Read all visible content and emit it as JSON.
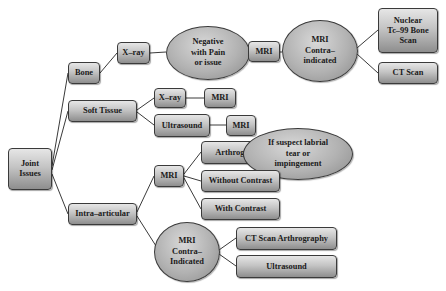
{
  "diagram": {
    "type": "tree",
    "root": "Joint Issues",
    "colors": {
      "node_fill_top": "#e6e6e6",
      "node_fill_bottom": "#8e8e8e",
      "border": "#3a3a3a",
      "edge": "#3a3a3a",
      "text": "#1a1a1a"
    },
    "nodes": {
      "joint_issues": {
        "lines": [
          "Joint",
          "Issues"
        ]
      },
      "bone": {
        "label": "Bone"
      },
      "bone_xray": {
        "label": "X–ray"
      },
      "negative_pain": {
        "lines": [
          "Negative",
          "with Pain",
          "or issue"
        ]
      },
      "bone_mri": {
        "label": "MRI"
      },
      "mri_contra_top": {
        "lines": [
          "MRI",
          "Contra–",
          "indicated"
        ]
      },
      "nuclear_scan": {
        "lines": [
          "Nuclear",
          "Tc–99 Bone",
          "Scan"
        ]
      },
      "ct_scan": {
        "label": "CT Scan"
      },
      "soft_tissue": {
        "label": "Soft Tissue"
      },
      "soft_xray": {
        "label": "X–ray"
      },
      "soft_xray_mri": {
        "label": "MRI"
      },
      "ultrasound": {
        "label": "Ultrasound"
      },
      "ultrasound_mri": {
        "label": "MRI"
      },
      "intra_articular": {
        "label": "Intra–articular"
      },
      "intra_mri": {
        "label": "MRI"
      },
      "arthrography": {
        "label": "Arthrography"
      },
      "suspect_labrial": {
        "lines": [
          "If suspect labrial",
          "tear or",
          "impingement"
        ]
      },
      "without_contrast": {
        "label": "Without Contrast"
      },
      "with_contrast": {
        "label": "With Contrast"
      },
      "mri_contra_bottom": {
        "lines": [
          "MRI",
          "Contra–",
          "Indicated"
        ]
      },
      "ct_arthrography": {
        "label": "CT Scan Arthrography"
      },
      "ultrasound_bottom": {
        "label": "Ultrasound"
      }
    },
    "edges": [
      [
        "Joint Issues",
        "Bone"
      ],
      [
        "Joint Issues",
        "Soft Tissue"
      ],
      [
        "Joint Issues",
        "Intra–articular"
      ],
      [
        "Bone",
        "X–ray"
      ],
      [
        "X–ray",
        "Negative with Pain or issue"
      ],
      [
        "Negative with Pain or issue",
        "MRI"
      ],
      [
        "MRI",
        "MRI Contra–indicated"
      ],
      [
        "MRI Contra–indicated",
        "Nuclear Tc–99 Bone Scan"
      ],
      [
        "MRI Contra–indicated",
        "CT Scan"
      ],
      [
        "Soft Tissue",
        "X–ray"
      ],
      [
        "X–ray",
        "MRI"
      ],
      [
        "Soft Tissue",
        "Ultrasound"
      ],
      [
        "Ultrasound",
        "MRI"
      ],
      [
        "Intra–articular",
        "MRI"
      ],
      [
        "MRI",
        "Arthrography"
      ],
      [
        "Arthrography",
        "If suspect labrial tear or impingement"
      ],
      [
        "MRI",
        "Without Contrast"
      ],
      [
        "MRI",
        "With Contrast"
      ],
      [
        "Intra–articular",
        "MRI Contra–Indicated"
      ],
      [
        "MRI Contra–Indicated",
        "CT Scan Arthrography"
      ],
      [
        "MRI Contra–Indicated",
        "Ultrasound"
      ]
    ]
  }
}
